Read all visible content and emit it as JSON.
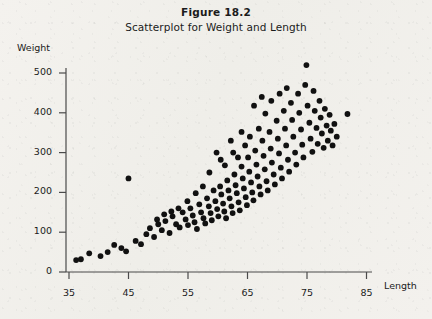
{
  "figure": {
    "number": "Figure 18.2",
    "caption": "Scatterplot for Weight and Length"
  },
  "colors": {
    "paper": "#f2f0ec",
    "ink": "#1b1b1b",
    "axis": "#4a4a4a",
    "point": "#111111"
  },
  "chart_data": {
    "type": "scatter",
    "title": "Figure 18.2",
    "subtitle": "Scatterplot for Weight and Length",
    "xlabel": "Length",
    "ylabel": "Weight",
    "xlim": [
      33,
      88
    ],
    "ylim": [
      -15,
      540
    ],
    "xticks": [
      35,
      45,
      55,
      65,
      75,
      85
    ],
    "yticks": [
      0,
      100,
      200,
      300,
      400,
      500
    ],
    "grid": false,
    "legend": null,
    "marker": "filled-circle",
    "series": [
      {
        "name": "Fish",
        "points": [
          [
            36.2,
            30
          ],
          [
            37.0,
            32
          ],
          [
            38.4,
            47
          ],
          [
            40.3,
            40
          ],
          [
            41.5,
            50
          ],
          [
            42.6,
            68
          ],
          [
            43.8,
            60
          ],
          [
            44.6,
            52
          ],
          [
            45.0,
            235
          ],
          [
            46.2,
            78
          ],
          [
            47.1,
            70
          ],
          [
            48.0,
            95
          ],
          [
            48.6,
            110
          ],
          [
            49.3,
            88
          ],
          [
            50.0,
            120
          ],
          [
            50.6,
            105
          ],
          [
            51.2,
            128
          ],
          [
            51.9,
            98
          ],
          [
            52.4,
            140
          ],
          [
            53.0,
            120
          ],
          [
            53.6,
            112
          ],
          [
            54.1,
            150
          ],
          [
            54.6,
            132
          ],
          [
            55.0,
            118
          ],
          [
            55.4,
            160
          ],
          [
            55.8,
            142
          ],
          [
            56.1,
            125
          ],
          [
            56.5,
            108
          ],
          [
            56.9,
            170
          ],
          [
            57.2,
            150
          ],
          [
            57.6,
            135
          ],
          [
            57.9,
            122
          ],
          [
            58.2,
            185
          ],
          [
            58.5,
            165
          ],
          [
            58.8,
            148
          ],
          [
            59.0,
            130
          ],
          [
            59.3,
            205
          ],
          [
            59.6,
            178
          ],
          [
            59.9,
            158
          ],
          [
            60.1,
            140
          ],
          [
            60.4,
            215
          ],
          [
            60.6,
            195
          ],
          [
            60.9,
            172
          ],
          [
            61.1,
            152
          ],
          [
            61.4,
            135
          ],
          [
            61.6,
            230
          ],
          [
            61.8,
            205
          ],
          [
            62.0,
            185
          ],
          [
            62.3,
            165
          ],
          [
            62.5,
            148
          ],
          [
            62.8,
            245
          ],
          [
            63.0,
            218
          ],
          [
            63.2,
            198
          ],
          [
            63.5,
            175
          ],
          [
            63.7,
            155
          ],
          [
            64.0,
            265
          ],
          [
            64.2,
            235
          ],
          [
            64.4,
            210
          ],
          [
            64.7,
            188
          ],
          [
            64.9,
            168
          ],
          [
            65.1,
            288
          ],
          [
            65.3,
            252
          ],
          [
            65.6,
            225
          ],
          [
            65.8,
            200
          ],
          [
            66.0,
            180
          ],
          [
            66.3,
            305
          ],
          [
            66.5,
            270
          ],
          [
            66.7,
            240
          ],
          [
            67.0,
            215
          ],
          [
            67.2,
            195
          ],
          [
            67.5,
            330
          ],
          [
            67.7,
            292
          ],
          [
            67.9,
            258
          ],
          [
            68.2,
            228
          ],
          [
            68.4,
            205
          ],
          [
            68.7,
            352
          ],
          [
            68.9,
            310
          ],
          [
            69.1,
            275
          ],
          [
            69.4,
            245
          ],
          [
            69.6,
            220
          ],
          [
            69.9,
            380
          ],
          [
            70.1,
            335
          ],
          [
            70.3,
            298
          ],
          [
            70.6,
            262
          ],
          [
            70.8,
            235
          ],
          [
            71.1,
            405
          ],
          [
            71.3,
            360
          ],
          [
            71.5,
            318
          ],
          [
            71.8,
            282
          ],
          [
            72.0,
            252
          ],
          [
            72.3,
            425
          ],
          [
            72.5,
            382
          ],
          [
            72.7,
            340
          ],
          [
            73.0,
            300
          ],
          [
            73.2,
            270
          ],
          [
            73.5,
            448
          ],
          [
            73.7,
            400
          ],
          [
            74.0,
            358
          ],
          [
            74.2,
            320
          ],
          [
            74.4,
            288
          ],
          [
            74.7,
            470
          ],
          [
            74.9,
            520
          ],
          [
            75.1,
            418
          ],
          [
            75.4,
            375
          ],
          [
            75.6,
            335
          ],
          [
            75.9,
            302
          ],
          [
            76.1,
            455
          ],
          [
            76.3,
            405
          ],
          [
            76.6,
            362
          ],
          [
            76.8,
            322
          ],
          [
            77.1,
            430
          ],
          [
            77.3,
            388
          ],
          [
            77.5,
            348
          ],
          [
            77.8,
            312
          ],
          [
            78.0,
            410
          ],
          [
            78.3,
            368
          ],
          [
            78.5,
            330
          ],
          [
            78.8,
            395
          ],
          [
            79.0,
            355
          ],
          [
            79.3,
            318
          ],
          [
            79.6,
            372
          ],
          [
            80.0,
            340
          ],
          [
            81.8,
            397
          ],
          [
            59.8,
            300
          ],
          [
            60.5,
            282
          ],
          [
            61.2,
            268
          ],
          [
            62.6,
            300
          ],
          [
            63.4,
            288
          ],
          [
            64.6,
            318
          ],
          [
            65.4,
            340
          ],
          [
            66.9,
            360
          ],
          [
            68.0,
            398
          ],
          [
            69.0,
            430
          ],
          [
            70.4,
            448
          ],
          [
            71.6,
            462
          ],
          [
            66.1,
            418
          ],
          [
            67.4,
            440
          ],
          [
            64.0,
            352
          ],
          [
            62.2,
            330
          ],
          [
            58.6,
            250
          ],
          [
            57.5,
            215
          ],
          [
            56.3,
            198
          ],
          [
            54.9,
            178
          ],
          [
            53.4,
            160
          ],
          [
            52.2,
            152
          ],
          [
            51.0,
            145
          ],
          [
            49.8,
            132
          ]
        ]
      }
    ]
  },
  "axis": {
    "x_tick_labels": [
      "35",
      "45",
      "55",
      "65",
      "75",
      "85"
    ],
    "y_tick_labels": [
      "0",
      "100",
      "200",
      "300",
      "400",
      "500"
    ]
  }
}
